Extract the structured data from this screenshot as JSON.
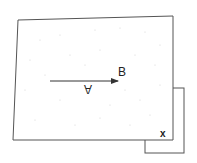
{
  "diagram": {
    "labels": {
      "arrow_head": "B",
      "arrow_tail_label": "A",
      "corner": "x"
    },
    "colors": {
      "stroke": "#555555",
      "text": "#222222",
      "speckle": "#cfcfcf"
    }
  }
}
